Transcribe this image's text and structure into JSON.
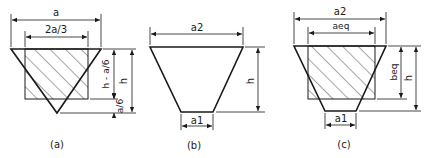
{
  "figure": {
    "panels": [
      {
        "id": "a",
        "caption": "(a)",
        "labels": {
          "top_width": "a",
          "inner_width": "2a/3",
          "upper_height": "h - a/6",
          "lower_height": "a/6",
          "total_height": "h"
        }
      },
      {
        "id": "b",
        "caption": "(b)",
        "labels": {
          "top_width": "a2",
          "bottom_width": "a1",
          "total_height": "h"
        }
      },
      {
        "id": "c",
        "caption": "(c)",
        "labels": {
          "top_width": "a2",
          "inner_width": "aeq",
          "eq_height": "beq",
          "bottom_width": "a1",
          "total_height": "h"
        }
      }
    ],
    "colors": {
      "line": "#1a1a1a",
      "background": "#ffffff"
    }
  }
}
